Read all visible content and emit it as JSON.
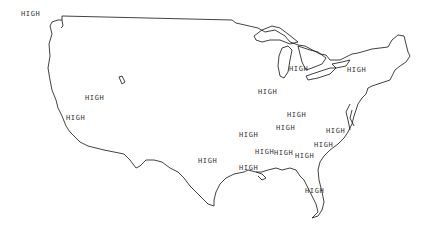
{
  "map": {
    "region": "Contiguous United States outline",
    "line_color": "#111111",
    "label_color": "#333333",
    "labels": [
      {
        "text": "HIGH",
        "x": 21,
        "y": 10
      },
      {
        "text": "HIGH",
        "x": 85,
        "y": 94
      },
      {
        "text": "HIGH",
        "x": 66,
        "y": 114
      },
      {
        "text": "HIGH",
        "x": 289,
        "y": 65
      },
      {
        "text": "HIGH",
        "x": 347,
        "y": 66
      },
      {
        "text": "HIGH",
        "x": 258,
        "y": 88
      },
      {
        "text": "HIGH",
        "x": 287,
        "y": 111
      },
      {
        "text": "HIGH",
        "x": 276,
        "y": 124
      },
      {
        "text": "HIGH",
        "x": 239,
        "y": 131
      },
      {
        "text": "HIGH",
        "x": 326,
        "y": 127
      },
      {
        "text": "HIGH",
        "x": 314,
        "y": 141
      },
      {
        "text": "HIGH",
        "x": 255,
        "y": 148
      },
      {
        "text": "HIGH",
        "x": 274,
        "y": 149
      },
      {
        "text": "HIGH",
        "x": 295,
        "y": 152
      },
      {
        "text": "HIGH",
        "x": 198,
        "y": 157
      },
      {
        "text": "HIGH",
        "x": 239,
        "y": 164
      },
      {
        "text": "HIGH",
        "x": 305,
        "y": 187
      }
    ]
  }
}
